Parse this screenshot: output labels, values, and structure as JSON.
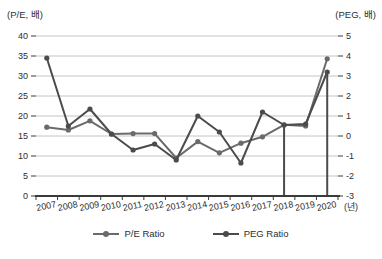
{
  "chart": {
    "left_axis_title": "(P/E, 배)",
    "right_axis_title": "(PEG, 배)",
    "x_axis_suffix": "(년)",
    "legend": {
      "pe_label": "P/E Ratio",
      "peg_label": "PEG Ratio"
    }
  },
  "chart_data": {
    "type": "line",
    "title": "",
    "categories": [
      "2007",
      "2008",
      "2009",
      "2010",
      "2011",
      "2012",
      "2013",
      "2014",
      "2015",
      "2016",
      "2017",
      "2018",
      "2019",
      "2020"
    ],
    "series": [
      {
        "name": "P/E Ratio",
        "axis": "left",
        "color": "#6a6a6a",
        "values": [
          17.2,
          16.5,
          18.8,
          15.5,
          15.6,
          15.6,
          9.5,
          13.6,
          10.8,
          13.2,
          14.8,
          17.8,
          17.5,
          34.3
        ]
      },
      {
        "name": "PEG Ratio",
        "axis": "right",
        "color": "#4b4b4b",
        "values": [
          3.9,
          0.5,
          1.35,
          0.1,
          -0.7,
          -0.4,
          -1.2,
          1.0,
          0.2,
          -1.35,
          1.2,
          0.55,
          0.6,
          3.2
        ]
      }
    ],
    "left_axis": {
      "title": "(P/E, 배)",
      "range": [
        0,
        40
      ],
      "ticks": [
        0,
        5,
        10,
        15,
        20,
        25,
        30,
        35,
        40
      ]
    },
    "right_axis": {
      "title": "(PEG, 배)",
      "range": [
        -3,
        5
      ],
      "ticks": [
        -3,
        -2,
        -1,
        0,
        1,
        2,
        3,
        4,
        5
      ]
    },
    "x_axis": {
      "title": "(년)"
    },
    "drop_lines": [
      {
        "category": "2018",
        "series": "PEG Ratio"
      },
      {
        "category": "2020",
        "series": "PEG Ratio"
      }
    ],
    "grid": true,
    "legend_position": "bottom",
    "colors": {
      "gridline": "#c4c4c4",
      "axis": "#3b3b3b",
      "text": "#2e2e2e"
    }
  }
}
